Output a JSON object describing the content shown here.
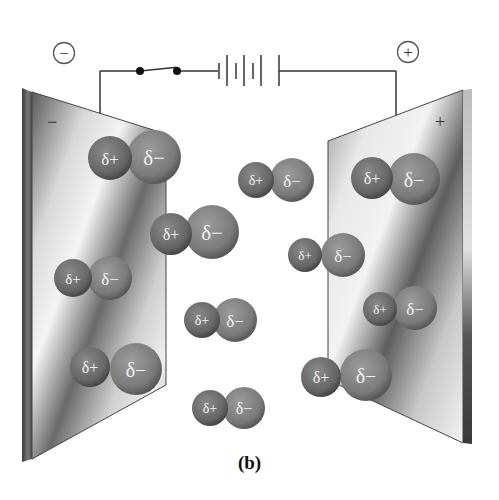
{
  "figure": {
    "caption": "(b)",
    "terminals": {
      "negative": "−",
      "positive": "+"
    },
    "plate_labels": {
      "left": "−",
      "right": "+"
    },
    "colors": {
      "background": "#ffffff",
      "wire": "#333333",
      "molecule_pos": "#6e6e6e",
      "molecule_neg": "#858585",
      "label": "#f2f2f2"
    }
  },
  "molecules": [
    {
      "pos": {
        "x": 110,
        "y": 158,
        "r": 22
      },
      "neg": {
        "x": 154,
        "y": 157,
        "r": 27
      },
      "pos_label": "δ+",
      "neg_label": "δ−"
    },
    {
      "pos": {
        "x": 171,
        "y": 234,
        "r": 21
      },
      "neg": {
        "x": 212,
        "y": 232,
        "r": 27
      },
      "pos_label": "δ+",
      "neg_label": "δ−"
    },
    {
      "pos": {
        "x": 73,
        "y": 278,
        "r": 19
      },
      "neg": {
        "x": 110,
        "y": 278,
        "r": 22
      },
      "pos_label": "δ+",
      "neg_label": "δ−"
    },
    {
      "pos": {
        "x": 90,
        "y": 367,
        "r": 20
      },
      "neg": {
        "x": 136,
        "y": 369,
        "r": 26
      },
      "pos_label": "δ+",
      "neg_label": "δ−"
    },
    {
      "pos": {
        "x": 256,
        "y": 180,
        "r": 18
      },
      "neg": {
        "x": 292,
        "y": 180,
        "r": 22
      },
      "pos_label": "δ+",
      "neg_label": "δ−"
    },
    {
      "pos": {
        "x": 305,
        "y": 255,
        "r": 17
      },
      "neg": {
        "x": 343,
        "y": 255,
        "r": 22
      },
      "pos_label": "δ+",
      "neg_label": "δ−"
    },
    {
      "pos": {
        "x": 202,
        "y": 320,
        "r": 18
      },
      "neg": {
        "x": 235,
        "y": 320,
        "r": 22
      },
      "pos_label": "δ+",
      "neg_label": "δ−"
    },
    {
      "pos": {
        "x": 210,
        "y": 408,
        "r": 18
      },
      "neg": {
        "x": 244,
        "y": 408,
        "r": 21
      },
      "pos_label": "δ+",
      "neg_label": "δ−"
    },
    {
      "pos": {
        "x": 372,
        "y": 178,
        "r": 21
      },
      "neg": {
        "x": 414,
        "y": 179,
        "r": 26
      },
      "pos_label": "δ+",
      "neg_label": "δ−"
    },
    {
      "pos": {
        "x": 380,
        "y": 309,
        "r": 17
      },
      "neg": {
        "x": 415,
        "y": 308,
        "r": 22
      },
      "pos_label": "δ+",
      "neg_label": "δ−"
    },
    {
      "pos": {
        "x": 321,
        "y": 377,
        "r": 20
      },
      "neg": {
        "x": 366,
        "y": 375,
        "r": 26
      },
      "pos_label": "δ+",
      "neg_label": "δ−"
    }
  ]
}
